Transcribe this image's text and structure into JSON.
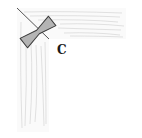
{
  "diagram": {
    "type": "woodworking-joint-illustration",
    "label": "C",
    "parts": [
      {
        "name": "horizontal-rail",
        "grain": "horizontal"
      },
      {
        "name": "vertical-stile",
        "grain": "vertical"
      },
      {
        "name": "miter-joint-line"
      },
      {
        "name": "butterfly-key"
      }
    ],
    "colors": {
      "outline": "#555555",
      "grain": "#c8c8c8",
      "key_fill": "#b4b4b4",
      "key_outline": "#3a3a3a",
      "label": "#1a1a1a"
    }
  }
}
